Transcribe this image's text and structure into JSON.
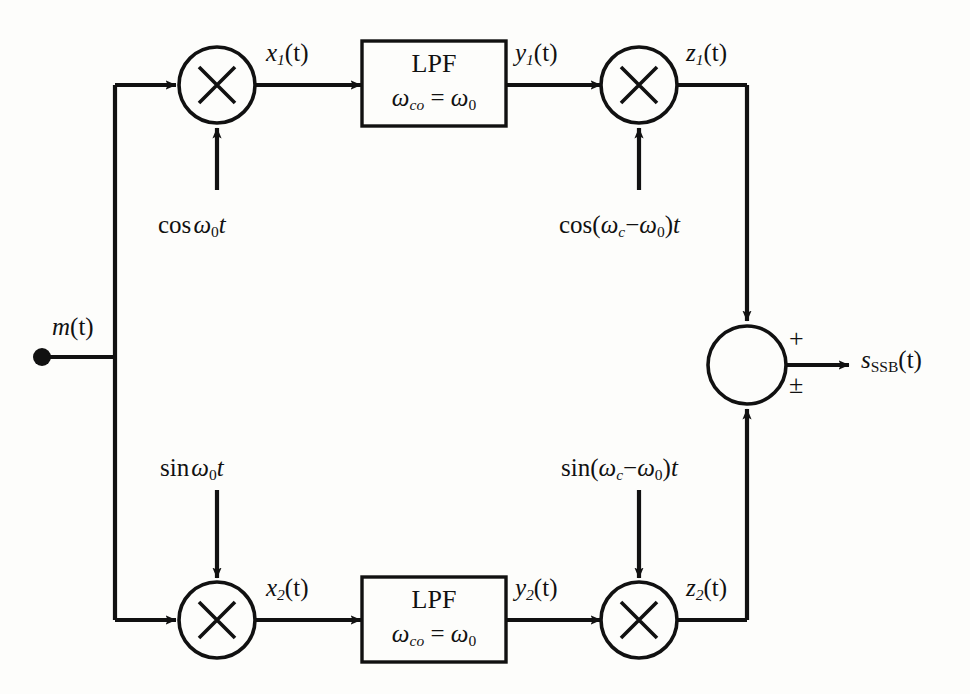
{
  "diagram": {
    "input": {
      "label_main": "m",
      "label_arg": "(t)"
    },
    "output": {
      "label_main": "s",
      "label_sub": "SSB",
      "label_arg": "(t)"
    },
    "signals": {
      "x1": {
        "base": "x",
        "sub": "1",
        "arg": "(t)"
      },
      "y1": {
        "base": "y",
        "sub": "1",
        "arg": "(t)"
      },
      "z1": {
        "base": "z",
        "sub": "1",
        "arg": "(t)"
      },
      "x2": {
        "base": "x",
        "sub": "2",
        "arg": "(t)"
      },
      "y2": {
        "base": "y",
        "sub": "2",
        "arg": "(t)"
      },
      "z2": {
        "base": "z",
        "sub": "2",
        "arg": "(t)"
      }
    },
    "multipliers": {
      "glyph": "×",
      "count": 4,
      "names": [
        "mixer-top-left",
        "mixer-top-right",
        "mixer-bottom-left",
        "mixer-bottom-right"
      ]
    },
    "filters": {
      "top": {
        "name": "LPF",
        "cutoff_prefix": "ω",
        "cutoff_sub": "co",
        "equals": " = ",
        "cutoff_value_prefix": "ω",
        "cutoff_value_sub": "0"
      },
      "bottom": {
        "name": "LPF",
        "cutoff_prefix": "ω",
        "cutoff_sub": "co",
        "equals": " = ",
        "cutoff_value_prefix": "ω",
        "cutoff_value_sub": "0"
      }
    },
    "oscillators": {
      "top_left": {
        "fn": "cos",
        "omega": "ω",
        "sub": "0",
        "t": "t",
        "full": "cos ω₀t"
      },
      "top_right": {
        "fn": "cos",
        "open": "(",
        "omega_c": "ω",
        "sub_c": "c",
        "minus": "−",
        "omega_0": "ω",
        "sub_0": "0",
        "close": ")",
        "t": "t",
        "full": "cos(ω_c−ω₀)t"
      },
      "bottom_left": {
        "fn": "sin",
        "omega": "ω",
        "sub": "0",
        "t": "t",
        "full": "sin ω₀t"
      },
      "bottom_right": {
        "fn": "sin",
        "open": "(",
        "omega_c": "ω",
        "sub_c": "c",
        "minus": "−",
        "omega_0": "ω",
        "sub_0": "0",
        "close": ")",
        "t": "t",
        "full": "sin(ω_c−ω₀)t"
      }
    },
    "summer": {
      "sign_top": "+",
      "sign_bottom": "±"
    },
    "colors": {
      "line": "#111111",
      "background": "#fdfdfb",
      "text": "#111111"
    }
  }
}
